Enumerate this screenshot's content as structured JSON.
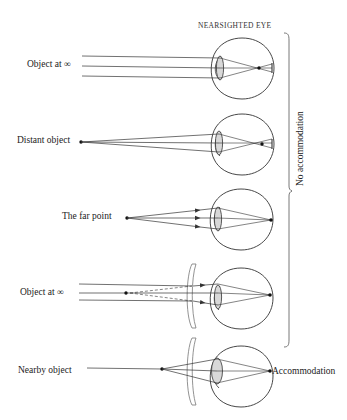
{
  "title": "NEARSIGHTED EYE",
  "rows": [
    {
      "label": "Object at ∞",
      "case": "parallel-rays-focus-in-front-of-retina"
    },
    {
      "label": "Distant object",
      "case": "distant-point-focus-in-front-of-retina"
    },
    {
      "label": "The far point",
      "case": "far-point-focus-on-retina"
    },
    {
      "label": "Object at ∞",
      "case": "diverging-lens-corrects-parallel-rays"
    },
    {
      "label": "Nearby object",
      "case": "diverging-lens-with-accommodation"
    }
  ],
  "brace_label": "No accommodation",
  "accommodation_label": "Accommodation",
  "colors": {
    "line": "#333333",
    "lens_fill": "#d8d8d8",
    "corrective_lens": "#777777",
    "background": "#ffffff"
  }
}
